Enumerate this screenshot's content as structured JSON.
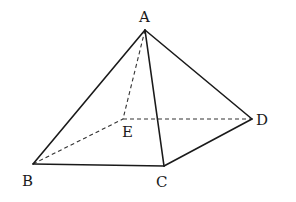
{
  "figure": {
    "type": "quadrilateral pyramid",
    "vertices": {
      "A": {
        "label": "A",
        "x": 145,
        "y": 30,
        "label_x": 139,
        "label_y": 22
      },
      "B": {
        "label": "B",
        "x": 33,
        "y": 164,
        "label_x": 22,
        "label_y": 186
      },
      "C": {
        "label": "C",
        "x": 164,
        "y": 166,
        "label_x": 156,
        "label_y": 187
      },
      "D": {
        "label": "D",
        "x": 252,
        "y": 119,
        "label_x": 256,
        "label_y": 125
      },
      "E": {
        "label": "E",
        "x": 123,
        "y": 119,
        "label_x": 122,
        "label_y": 137
      }
    },
    "solid_edges": [
      [
        "A",
        "B"
      ],
      [
        "A",
        "C"
      ],
      [
        "A",
        "D"
      ],
      [
        "B",
        "C"
      ],
      [
        "C",
        "D"
      ]
    ],
    "dashed_edges": [
      [
        "A",
        "E"
      ],
      [
        "B",
        "E"
      ],
      [
        "E",
        "D"
      ]
    ]
  }
}
